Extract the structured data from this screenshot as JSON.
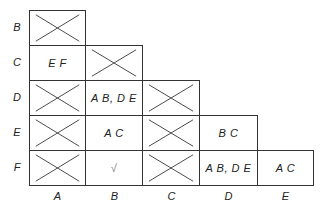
{
  "diagram": {
    "type": "implication-table",
    "row_labels": [
      "B",
      "C",
      "D",
      "E",
      "F"
    ],
    "col_labels": [
      "A",
      "B",
      "C",
      "D",
      "E"
    ],
    "cells": {
      "B_A": {
        "crossed": true,
        "text": ""
      },
      "C_A": {
        "crossed": false,
        "text": "E F"
      },
      "C_B": {
        "crossed": true,
        "text": ""
      },
      "D_A": {
        "crossed": true,
        "text": ""
      },
      "D_B": {
        "crossed": false,
        "text": "A B, D E"
      },
      "D_C": {
        "crossed": true,
        "text": ""
      },
      "E_A": {
        "crossed": true,
        "text": ""
      },
      "E_B": {
        "crossed": false,
        "text": "A C"
      },
      "E_C": {
        "crossed": true,
        "text": ""
      },
      "E_D": {
        "crossed": false,
        "text": "B C"
      },
      "F_A": {
        "crossed": true,
        "text": ""
      },
      "F_B": {
        "crossed": false,
        "text": "√"
      },
      "F_C": {
        "crossed": true,
        "text": ""
      },
      "F_D": {
        "crossed": false,
        "text": "A B, D E"
      },
      "F_E": {
        "crossed": false,
        "text": "A C"
      }
    }
  }
}
